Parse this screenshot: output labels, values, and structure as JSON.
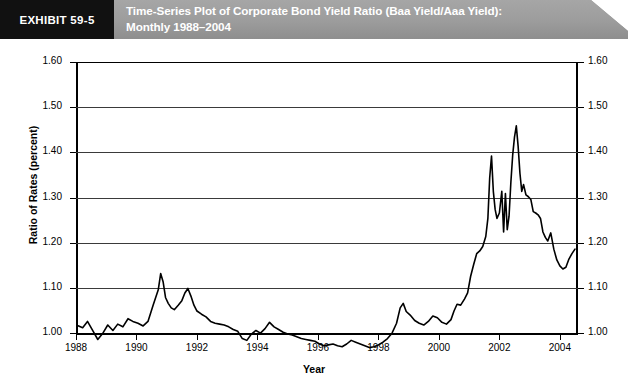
{
  "header": {
    "exhibit_label": "EXHIBIT 59-5",
    "title_line1": "Time-Series Plot of Corporate Bond Yield Ratio (Baa Yield/Aaa Yield):",
    "title_line2": "Monthly 1988–2004",
    "banner_color": "#9a9a9a",
    "exhibit_block_color": "#111111"
  },
  "chart_data": {
    "type": "line",
    "title": "Time-Series Plot of Corporate Bond Yield Ratio (Baa Yield/Aaa Yield): Monthly 1988–2004",
    "xlabel": "Year",
    "ylabel": "Ratio of Rates (percent)",
    "ylabel_right": "Ratio of Rates (percent)",
    "xlim": [
      1988,
      2004.6
    ],
    "ylim": [
      1.0,
      1.6
    ],
    "ytick_values": [
      1.0,
      1.1,
      1.2,
      1.3,
      1.4,
      1.5,
      1.6
    ],
    "ytick_labels": [
      "1.00",
      "1.10",
      "1.20",
      "1.30",
      "1.40",
      "1.50",
      "1.60"
    ],
    "xtick_values": [
      1988,
      1990,
      1992,
      1994,
      1996,
      1998,
      2000,
      2002,
      2004
    ],
    "xtick_labels": [
      "1988",
      "1990",
      "1992",
      "1994",
      "1996",
      "1998",
      "2000",
      "2002",
      "2004"
    ],
    "grid": "horizontal",
    "legend": "none",
    "line_color": "#000000",
    "series": [
      {
        "name": "Baa Yield / Aaa Yield",
        "x": [
          1988.05,
          1988.22,
          1988.38,
          1988.55,
          1988.72,
          1988.88,
          1989.05,
          1989.22,
          1989.38,
          1989.55,
          1989.72,
          1989.88,
          1990.05,
          1990.22,
          1990.38,
          1990.55,
          1990.72,
          1990.8,
          1990.88,
          1990.96,
          1991.05,
          1991.15,
          1991.25,
          1991.38,
          1991.5,
          1991.6,
          1991.7,
          1991.8,
          1991.9,
          1992.0,
          1992.15,
          1992.3,
          1992.45,
          1992.6,
          1992.75,
          1992.9,
          1993.05,
          1993.2,
          1993.35,
          1993.5,
          1993.65,
          1993.8,
          1993.95,
          1994.1,
          1994.25,
          1994.4,
          1994.55,
          1994.7,
          1994.85,
          1995.0,
          1995.15,
          1995.3,
          1995.45,
          1995.6,
          1995.75,
          1995.9,
          1996.05,
          1996.2,
          1996.35,
          1996.5,
          1996.65,
          1996.8,
          1996.95,
          1997.1,
          1997.25,
          1997.4,
          1997.55,
          1997.7,
          1997.85,
          1998.0,
          1998.15,
          1998.3,
          1998.45,
          1998.6,
          1998.72,
          1998.82,
          1998.92,
          1999.05,
          1999.2,
          1999.35,
          1999.5,
          1999.65,
          1999.8,
          1999.95,
          2000.1,
          2000.25,
          2000.4,
          2000.5,
          2000.6,
          2000.72,
          2000.85,
          2000.95,
          2001.05,
          2001.15,
          2001.25,
          2001.35,
          2001.45,
          2001.55,
          2001.62,
          2001.68,
          2001.74,
          2001.8,
          2001.86,
          2001.92,
          2002.0,
          2002.08,
          2002.14,
          2002.2,
          2002.26,
          2002.32,
          2002.38,
          2002.44,
          2002.5,
          2002.56,
          2002.62,
          2002.68,
          2002.74,
          2002.8,
          2002.88,
          2002.96,
          2003.04,
          2003.12,
          2003.2,
          2003.28,
          2003.36,
          2003.44,
          2003.52,
          2003.6,
          2003.7,
          2003.8,
          2003.9,
          2004.0,
          2004.1,
          2004.2,
          2004.3,
          2004.4,
          2004.5
        ],
        "y": [
          1.103,
          1.098,
          1.112,
          1.092,
          1.072,
          1.085,
          1.104,
          1.092,
          1.106,
          1.1,
          1.118,
          1.112,
          1.108,
          1.102,
          1.112,
          1.148,
          1.182,
          1.218,
          1.2,
          1.165,
          1.152,
          1.142,
          1.138,
          1.148,
          1.158,
          1.175,
          1.185,
          1.168,
          1.148,
          1.135,
          1.128,
          1.122,
          1.112,
          1.108,
          1.106,
          1.104,
          1.1,
          1.094,
          1.09,
          1.074,
          1.07,
          1.084,
          1.092,
          1.086,
          1.096,
          1.11,
          1.1,
          1.094,
          1.088,
          1.084,
          1.082,
          1.078,
          1.074,
          1.072,
          1.07,
          1.068,
          1.062,
          1.058,
          1.06,
          1.062,
          1.058,
          1.056,
          1.062,
          1.07,
          1.066,
          1.062,
          1.058,
          1.054,
          1.056,
          1.06,
          1.066,
          1.074,
          1.086,
          1.108,
          1.142,
          1.152,
          1.134,
          1.126,
          1.114,
          1.108,
          1.104,
          1.112,
          1.124,
          1.12,
          1.11,
          1.106,
          1.116,
          1.135,
          1.15,
          1.148,
          1.162,
          1.175,
          1.212,
          1.238,
          1.262,
          1.268,
          1.278,
          1.3,
          1.34,
          1.43,
          1.478,
          1.4,
          1.36,
          1.34,
          1.352,
          1.4,
          1.31,
          1.395,
          1.315,
          1.345,
          1.42,
          1.48,
          1.52,
          1.545,
          1.5,
          1.44,
          1.4,
          1.415,
          1.392,
          1.388,
          1.382,
          1.355,
          1.352,
          1.348,
          1.34,
          1.31,
          1.298,
          1.29,
          1.308,
          1.272,
          1.248,
          1.235,
          1.228,
          1.232,
          1.25,
          1.262,
          1.272
        ]
      }
    ]
  }
}
